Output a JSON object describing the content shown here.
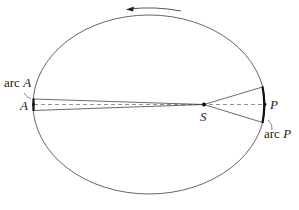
{
  "diagram": {
    "labels": {
      "arc_a_prefix": "arc ",
      "arc_a_var": "A",
      "point_a": "A",
      "point_s": "S",
      "point_p": "P",
      "arc_p_prefix": "arc ",
      "arc_p_var": "P"
    },
    "orbit": {
      "cx": 149,
      "cy": 104.5,
      "rx": 116,
      "ry": 89.5
    },
    "colors": {
      "line": "#555555",
      "arc_highlight": "#111111",
      "dashed": "#777777"
    }
  }
}
